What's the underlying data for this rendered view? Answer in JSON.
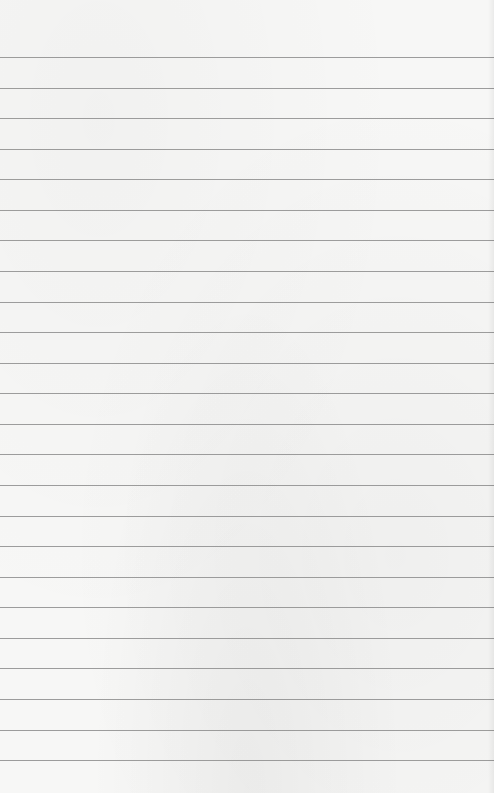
{
  "paper": {
    "type": "lined-paper",
    "background_color": "#f7f7f6",
    "line_color": "#8c8c8c",
    "line_count": 24,
    "first_line_y": 57,
    "line_spacing": 30.57,
    "text": ""
  }
}
